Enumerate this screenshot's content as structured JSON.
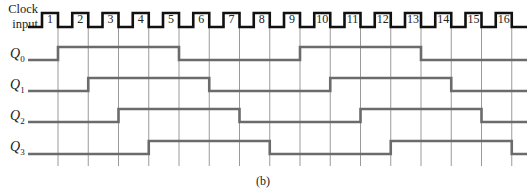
{
  "figure": {
    "caption": "(b)",
    "clock_label_line1": "Clock",
    "clock_label_line2": "input",
    "colors": {
      "clock": "#111111",
      "waveform": "#6b6b6b",
      "gridline": "#9a9a9a",
      "text": "#222222"
    }
  },
  "clock": {
    "pulses": [
      "1",
      "2",
      "3",
      "4",
      "5",
      "6",
      "7",
      "8",
      "9",
      "10",
      "11",
      "12",
      "13",
      "14",
      "15",
      "16"
    ]
  },
  "signals": [
    {
      "name": "Q",
      "sub": "0",
      "rise_edges": [
        1,
        9
      ],
      "fall_edges": [
        5,
        13
      ],
      "initial": 0
    },
    {
      "name": "Q",
      "sub": "1",
      "rise_edges": [
        2,
        10
      ],
      "fall_edges": [
        6,
        14
      ],
      "initial": 0
    },
    {
      "name": "Q",
      "sub": "2",
      "rise_edges": [
        3,
        11
      ],
      "fall_edges": [
        7,
        15
      ],
      "initial": 0
    },
    {
      "name": "Q",
      "sub": "3",
      "rise_edges": [
        4,
        12
      ],
      "fall_edges": [
        8,
        16
      ],
      "initial": 0
    }
  ],
  "chart_data": {
    "type": "line",
    "title": "",
    "caption": "(b)",
    "xlabel": "Clock pulse",
    "ylabel": "",
    "x": [
      0,
      1,
      2,
      3,
      4,
      5,
      6,
      7,
      8,
      9,
      10,
      11,
      12,
      13,
      14,
      15,
      16
    ],
    "series": [
      {
        "name": "Clock input",
        "pulses": 16
      },
      {
        "name": "Q0",
        "values": [
          0,
          1,
          1,
          1,
          1,
          0,
          0,
          0,
          0,
          1,
          1,
          1,
          1,
          0,
          0,
          0,
          0
        ]
      },
      {
        "name": "Q1",
        "values": [
          0,
          0,
          1,
          1,
          1,
          1,
          0,
          0,
          0,
          0,
          1,
          1,
          1,
          1,
          0,
          0,
          0
        ]
      },
      {
        "name": "Q2",
        "values": [
          0,
          0,
          0,
          1,
          1,
          1,
          1,
          0,
          0,
          0,
          0,
          1,
          1,
          1,
          1,
          0,
          0
        ]
      },
      {
        "name": "Q3",
        "values": [
          0,
          0,
          0,
          0,
          1,
          1,
          1,
          1,
          0,
          0,
          0,
          0,
          1,
          1,
          1,
          1,
          0
        ]
      }
    ],
    "grid": "vertical lines at each clock falling edge",
    "legend": "none"
  }
}
